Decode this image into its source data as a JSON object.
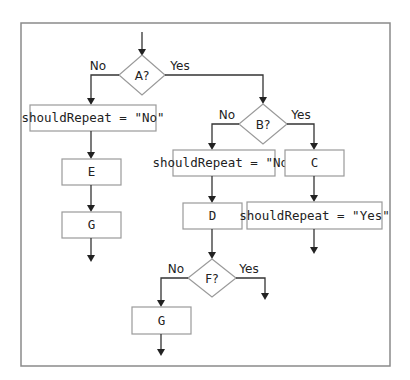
{
  "diagram": {
    "type": "flowchart",
    "decisions": {
      "a": {
        "label": "A?",
        "no": "No",
        "yes": "Yes"
      },
      "b": {
        "label": "B?",
        "no": "No",
        "yes": "Yes"
      },
      "f": {
        "label": "F?",
        "no": "No",
        "yes": "Yes"
      }
    },
    "processes": {
      "a_no_assign": "shouldRepeat = \"No\"",
      "e": "E",
      "g_left": "G",
      "b_no_assign": "shouldRepeat = \"No\"",
      "c": "C",
      "d": "D",
      "c_yes_assign": "shouldRepeat = \"Yes\"",
      "g_bottom": "G"
    },
    "flow": [
      "start -> A?",
      "A? No -> shouldRepeat = \"No\" -> E -> G -> end",
      "A? Yes -> B?",
      "B? No -> shouldRepeat = \"No\" -> D -> F?",
      "F? No -> G -> end",
      "F? Yes -> end",
      "B? Yes -> C -> shouldRepeat = \"Yes\" -> end"
    ]
  }
}
